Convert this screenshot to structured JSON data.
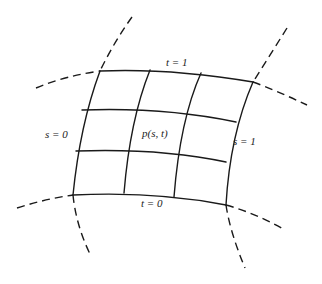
{
  "figure": {
    "colors": {
      "line": "#1a1a1a",
      "background": "#ffffff",
      "text": "#222222"
    },
    "labels": {
      "t1": "t = 1",
      "t0": "t = 0",
      "s0": "s = 0",
      "s1": "s = 1",
      "point": "p(s, t)"
    }
  }
}
